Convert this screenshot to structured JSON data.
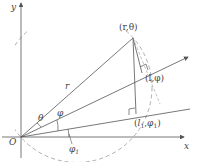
{
  "diagram": {
    "axes": {
      "x_label": "x",
      "y_label": "y",
      "origin_label": "O"
    },
    "points": [
      {
        "id": "r_theta",
        "label": "(r,θ)"
      },
      {
        "id": "l_phi",
        "label": "(l,φ)"
      },
      {
        "id": "l1_phi1",
        "label_open": "(",
        "label_l": "l",
        "label_l_sub": "1",
        "label_sep": ",",
        "label_phi": "φ",
        "label_phi_sub": "1",
        "label_close": ")"
      }
    ],
    "segment_labels": {
      "r": "r"
    },
    "angle_labels": {
      "theta": "θ",
      "phi": "φ",
      "phi1": "φ",
      "phi1_sub": "1"
    },
    "colors": {
      "line": "#555555",
      "dashed": "#888888",
      "background": "#ffffff"
    }
  }
}
